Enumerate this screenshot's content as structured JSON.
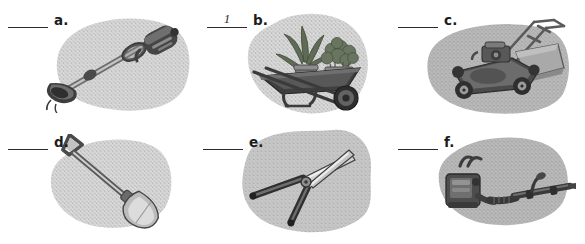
{
  "worksheet": {
    "type": "matching-exercise",
    "layout": {
      "columns": 3,
      "rows": 2
    },
    "colors": {
      "page_background": "#ffffff",
      "blob_light": "#d6d6d6",
      "blob_mid": "#c6c6c6",
      "blob_dark": "#b4b4b4",
      "speckle": "#8f8f8f",
      "ink": "#1c1c1c",
      "tool_dark": "#3a3a3a",
      "tool_mid": "#777777",
      "tool_light": "#c9c9c9",
      "plant_green": "#5d6b52"
    },
    "items": [
      {
        "id": "a",
        "letter": "a.",
        "answer": "",
        "answered": false,
        "subject": "string-trimmer",
        "blob": "light"
      },
      {
        "id": "b",
        "letter": "b.",
        "answer": "1",
        "answered": true,
        "subject": "wheelbarrow-with-potted-plants",
        "blob": "light"
      },
      {
        "id": "c",
        "letter": "c.",
        "answer": "",
        "answered": false,
        "subject": "lawn-mower",
        "blob": "dark"
      },
      {
        "id": "d",
        "letter": "d.",
        "answer": "",
        "answered": false,
        "subject": "shovel",
        "blob": "light"
      },
      {
        "id": "e",
        "letter": "e.",
        "answer": "",
        "answered": false,
        "subject": "hedge-shears",
        "blob": "mid"
      },
      {
        "id": "f",
        "letter": "f.",
        "answer": "",
        "answered": false,
        "subject": "backpack-leaf-blower",
        "blob": "dark"
      }
    ]
  }
}
